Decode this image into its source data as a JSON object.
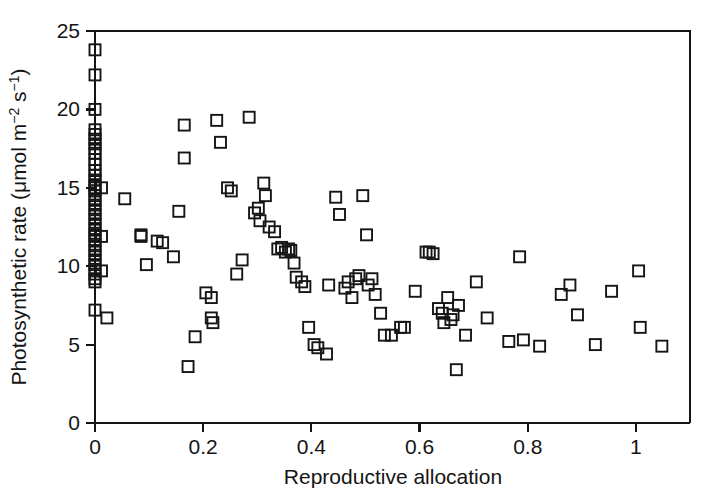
{
  "figure": {
    "title": "",
    "background_color": "#ffffff",
    "ink_color": "#141414"
  },
  "axes": {
    "x": {
      "label": "Reproductive allocation",
      "ticks": [
        "0",
        "0.2",
        "0.4",
        "0.6",
        "0.8",
        "1"
      ],
      "tick_values": [
        0,
        0.2,
        0.4,
        0.6,
        0.8,
        1
      ],
      "range": [
        0,
        1.1
      ]
    },
    "y": {
      "label_parts": {
        "main": "Photosynthetic rate (",
        "mu": "μmol m",
        "sup1": "−2",
        "mid": " s",
        "sup2": "−1",
        "close": ")"
      },
      "label": "Photosynthetic rate (μmol m−2 s−1)",
      "ticks": [
        "0",
        "5",
        "10",
        "15",
        "20",
        "25"
      ],
      "tick_values": [
        0,
        5,
        10,
        15,
        20,
        25
      ],
      "range": [
        0,
        25
      ]
    }
  },
  "chart_data": {
    "type": "scatter",
    "title": "",
    "xlabel": "Reproductive allocation",
    "ylabel": "Photosynthetic rate (μmol m−2 s−1)",
    "xlim": [
      0,
      1.1
    ],
    "ylim": [
      0,
      25
    ],
    "grid": false,
    "legend": null,
    "marker": {
      "shape": "open-square",
      "size_px": 11,
      "fill": "none",
      "edge_color": "#151515",
      "edge_width": 1.9
    },
    "series": [
      {
        "name": "Individuals",
        "points": [
          [
            0.0,
            23.8
          ],
          [
            0.0,
            22.2
          ],
          [
            0.0,
            20.0
          ],
          [
            0.0,
            18.7
          ],
          [
            0.0,
            18.4
          ],
          [
            0.0,
            18.1
          ],
          [
            0.0,
            17.8
          ],
          [
            0.0,
            17.5
          ],
          [
            0.0,
            17.2
          ],
          [
            0.0,
            16.8
          ],
          [
            0.0,
            16.5
          ],
          [
            0.0,
            16.1
          ],
          [
            0.0,
            15.8
          ],
          [
            0.0,
            15.5
          ],
          [
            0.0,
            15.2
          ],
          [
            0.0,
            15.0
          ],
          [
            0.0,
            14.8
          ],
          [
            0.0,
            14.5
          ],
          [
            0.0,
            14.2
          ],
          [
            0.0,
            13.9
          ],
          [
            0.0,
            13.6
          ],
          [
            0.0,
            13.3
          ],
          [
            0.0,
            13.0
          ],
          [
            0.0,
            12.7
          ],
          [
            0.0,
            12.4
          ],
          [
            0.0,
            12.1
          ],
          [
            0.0,
            11.9
          ],
          [
            0.0,
            11.6
          ],
          [
            0.0,
            11.3
          ],
          [
            0.0,
            11.0
          ],
          [
            0.0,
            10.7
          ],
          [
            0.0,
            10.4
          ],
          [
            0.0,
            10.1
          ],
          [
            0.0,
            9.8
          ],
          [
            0.0,
            9.5
          ],
          [
            0.0,
            9.2
          ],
          [
            0.0,
            9.0
          ],
          [
            0.0,
            7.2
          ],
          [
            0.012,
            15.0
          ],
          [
            0.012,
            11.9
          ],
          [
            0.012,
            9.7
          ],
          [
            0.022,
            6.7
          ],
          [
            0.055,
            14.3
          ],
          [
            0.085,
            11.9
          ],
          [
            0.085,
            12.0
          ],
          [
            0.095,
            10.1
          ],
          [
            0.115,
            11.6
          ],
          [
            0.125,
            11.5
          ],
          [
            0.145,
            10.6
          ],
          [
            0.155,
            13.5
          ],
          [
            0.165,
            19.0
          ],
          [
            0.165,
            16.9
          ],
          [
            0.172,
            3.6
          ],
          [
            0.185,
            5.5
          ],
          [
            0.205,
            8.3
          ],
          [
            0.215,
            8.0
          ],
          [
            0.215,
            6.7
          ],
          [
            0.218,
            6.4
          ],
          [
            0.225,
            19.3
          ],
          [
            0.232,
            17.9
          ],
          [
            0.245,
            15.0
          ],
          [
            0.252,
            14.8
          ],
          [
            0.262,
            9.5
          ],
          [
            0.272,
            10.4
          ],
          [
            0.285,
            19.5
          ],
          [
            0.295,
            13.4
          ],
          [
            0.302,
            13.7
          ],
          [
            0.305,
            12.9
          ],
          [
            0.312,
            15.3
          ],
          [
            0.315,
            14.5
          ],
          [
            0.322,
            12.5
          ],
          [
            0.332,
            12.2
          ],
          [
            0.338,
            11.1
          ],
          [
            0.345,
            11.2
          ],
          [
            0.352,
            10.9
          ],
          [
            0.358,
            11.1
          ],
          [
            0.362,
            11.0
          ],
          [
            0.368,
            10.2
          ],
          [
            0.372,
            9.3
          ],
          [
            0.382,
            9.0
          ],
          [
            0.388,
            8.7
          ],
          [
            0.395,
            6.1
          ],
          [
            0.405,
            5.0
          ],
          [
            0.412,
            4.8
          ],
          [
            0.428,
            4.4
          ],
          [
            0.432,
            8.8
          ],
          [
            0.445,
            14.4
          ],
          [
            0.452,
            13.3
          ],
          [
            0.462,
            8.6
          ],
          [
            0.468,
            9.0
          ],
          [
            0.475,
            8.0
          ],
          [
            0.482,
            9.2
          ],
          [
            0.488,
            9.4
          ],
          [
            0.495,
            14.5
          ],
          [
            0.502,
            12.0
          ],
          [
            0.505,
            8.8
          ],
          [
            0.512,
            9.2
          ],
          [
            0.518,
            8.2
          ],
          [
            0.528,
            7.0
          ],
          [
            0.535,
            5.6
          ],
          [
            0.548,
            5.6
          ],
          [
            0.565,
            6.1
          ],
          [
            0.572,
            6.1
          ],
          [
            0.592,
            8.4
          ],
          [
            0.612,
            10.9
          ],
          [
            0.618,
            10.9
          ],
          [
            0.625,
            10.8
          ],
          [
            0.635,
            7.3
          ],
          [
            0.642,
            7.0
          ],
          [
            0.645,
            6.4
          ],
          [
            0.652,
            8.0
          ],
          [
            0.658,
            6.6
          ],
          [
            0.662,
            6.9
          ],
          [
            0.668,
            3.4
          ],
          [
            0.672,
            7.5
          ],
          [
            0.685,
            5.6
          ],
          [
            0.705,
            9.0
          ],
          [
            0.725,
            6.7
          ],
          [
            0.765,
            5.2
          ],
          [
            0.785,
            10.6
          ],
          [
            0.792,
            5.3
          ],
          [
            0.822,
            4.9
          ],
          [
            0.862,
            8.2
          ],
          [
            0.878,
            8.8
          ],
          [
            0.892,
            6.9
          ],
          [
            0.925,
            5.0
          ],
          [
            0.955,
            8.4
          ],
          [
            1.005,
            9.7
          ],
          [
            1.008,
            6.1
          ],
          [
            1.048,
            4.9
          ]
        ]
      }
    ]
  }
}
